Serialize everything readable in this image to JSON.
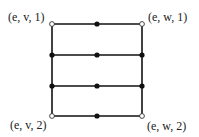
{
  "diagram": {
    "type": "graph",
    "labels": {
      "top_left": "(e, v, 1)",
      "top_right": "(e, w, 1)",
      "bottom_left": "(e, v, 2)",
      "bottom_right": "(e, w, 2)"
    },
    "geometry": {
      "left_x": 52,
      "right_x": 142,
      "mid_x": 97,
      "rows_y": [
        24,
        55,
        86,
        116
      ]
    },
    "nodes": [
      {
        "id": "tl",
        "x": 52,
        "y": 24,
        "style": "open",
        "label": "(e, v, 1)"
      },
      {
        "id": "tm",
        "x": 97,
        "y": 24,
        "style": "filled"
      },
      {
        "id": "tr",
        "x": 142,
        "y": 24,
        "style": "open",
        "label": "(e, w, 1)"
      },
      {
        "id": "r2l",
        "x": 52,
        "y": 55,
        "style": "filled"
      },
      {
        "id": "r2m",
        "x": 97,
        "y": 55,
        "style": "filled"
      },
      {
        "id": "r2r",
        "x": 142,
        "y": 55,
        "style": "filled"
      },
      {
        "id": "r3l",
        "x": 52,
        "y": 86,
        "style": "filled"
      },
      {
        "id": "r3m",
        "x": 97,
        "y": 86,
        "style": "filled"
      },
      {
        "id": "r3r",
        "x": 142,
        "y": 86,
        "style": "filled"
      },
      {
        "id": "bl",
        "x": 52,
        "y": 116,
        "style": "open",
        "label": "(e, v, 2)"
      },
      {
        "id": "bm",
        "x": 97,
        "y": 116,
        "style": "filled"
      },
      {
        "id": "br",
        "x": 142,
        "y": 116,
        "style": "open",
        "label": "(e, w, 2)"
      }
    ],
    "colors": {
      "line": "#111111",
      "fill": "#111111",
      "open_fill": "#ffffff"
    }
  }
}
